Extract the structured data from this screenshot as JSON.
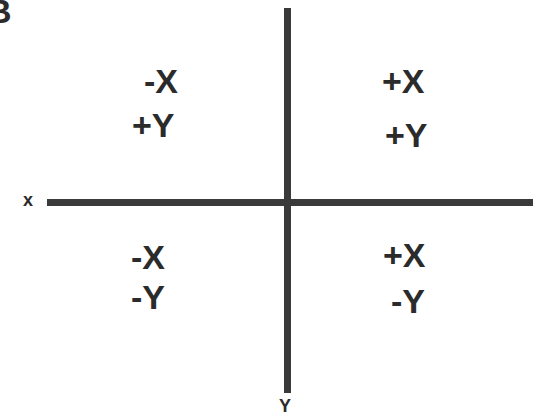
{
  "panel_label": "B",
  "axes": {
    "x_label": "x",
    "y_label": "Y"
  },
  "quadrants": {
    "top_left": {
      "x_sign": "-X",
      "y_sign": "+Y"
    },
    "top_right": {
      "x_sign": "+X",
      "y_sign": "+Y"
    },
    "bottom_left": {
      "x_sign": "-X",
      "y_sign": "-Y"
    },
    "bottom_right": {
      "x_sign": "+X",
      "y_sign": "-Y"
    }
  },
  "colors": {
    "axis": "#3a3a3a",
    "text": "#2b2b2b",
    "background": "#ffffff"
  }
}
